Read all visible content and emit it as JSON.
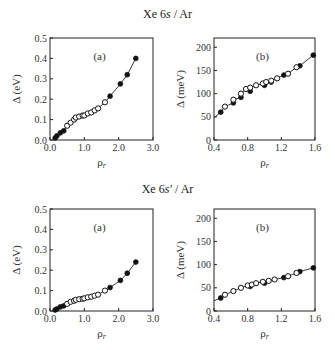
{
  "sections": [
    {
      "title_main": "Xe 6",
      "title_italic": "s",
      "title_rest": " / Ar"
    },
    {
      "title_main": "Xe 6",
      "title_italic": "s′",
      "title_rest": " / Ar"
    }
  ],
  "chart_data": [
    {
      "type": "scatter",
      "section": "Xe 6s / Ar",
      "panel_label": "(a)",
      "xlabel": "ρ_r",
      "ylabel": "Δ (eV)",
      "xlim": [
        0,
        3.0
      ],
      "ylim": [
        0,
        0.5
      ],
      "xticks": [
        "0.0",
        "1.0",
        "2.0",
        "3.0"
      ],
      "yticks": [
        "0.0",
        "0.1",
        "0.2",
        "0.3",
        "0.4",
        "0.5"
      ],
      "series": [
        {
          "name": "filled",
          "marker": "filled-circle",
          "line": true,
          "x": [
            0.15,
            0.2,
            0.3,
            0.4,
            1.75,
            2.05,
            2.25,
            2.5
          ],
          "y": [
            0.01,
            0.02,
            0.035,
            0.045,
            0.215,
            0.275,
            0.32,
            0.4
          ]
        },
        {
          "name": "open",
          "marker": "open-circle",
          "line": false,
          "x": [
            0.5,
            0.6,
            0.7,
            0.75,
            0.85,
            0.95,
            1.0,
            1.1,
            1.2,
            1.3,
            1.4,
            1.6
          ],
          "y": [
            0.07,
            0.085,
            0.1,
            0.11,
            0.115,
            0.12,
            0.12,
            0.13,
            0.135,
            0.145,
            0.155,
            0.185
          ]
        }
      ]
    },
    {
      "type": "scatter",
      "section": "Xe 6s / Ar",
      "panel_label": "(b)",
      "xlabel": "ρ_r",
      "ylabel": "Δ (meV)",
      "xlim": [
        0.4,
        1.6
      ],
      "ylim": [
        0,
        220
      ],
      "xticks": [
        "0.4",
        "0.8",
        "1.2",
        "1.6"
      ],
      "yticks": [
        "0",
        "50",
        "100",
        "150",
        "200"
      ],
      "series": [
        {
          "name": "filled",
          "marker": "filled-circle",
          "line": true,
          "x": [
            0.4,
            0.48,
            0.63,
            0.72,
            0.83,
            1.0,
            1.08,
            1.23,
            1.42,
            1.58
          ],
          "y": [
            48,
            60,
            80,
            92,
            105,
            118,
            125,
            140,
            160,
            183
          ]
        },
        {
          "name": "open",
          "marker": "open-circle",
          "line": false,
          "x": [
            0.53,
            0.63,
            0.72,
            0.78,
            0.83,
            0.9,
            0.98,
            1.02,
            1.08,
            1.15,
            1.28,
            1.38
          ],
          "y": [
            72,
            87,
            100,
            110,
            113,
            118,
            122,
            125,
            128,
            133,
            143,
            157
          ]
        }
      ]
    },
    {
      "type": "scatter",
      "section": "Xe 6s′ / Ar",
      "panel_label": "(a)",
      "xlabel": "ρ_r",
      "ylabel": "Δ (eV)",
      "xlim": [
        0,
        3.0
      ],
      "ylim": [
        0,
        0.5
      ],
      "xticks": [
        "0.0",
        "1.0",
        "2.0",
        "3.0"
      ],
      "yticks": [
        "0.0",
        "0.1",
        "0.2",
        "0.3",
        "0.4",
        "0.5"
      ],
      "series": [
        {
          "name": "filled",
          "marker": "filled-circle",
          "line": true,
          "x": [
            0.15,
            0.2,
            0.3,
            0.4,
            1.75,
            2.05,
            2.25,
            2.5
          ],
          "y": [
            0.005,
            0.01,
            0.02,
            0.025,
            0.115,
            0.15,
            0.185,
            0.24
          ]
        },
        {
          "name": "open",
          "marker": "open-circle",
          "line": false,
          "x": [
            0.5,
            0.6,
            0.7,
            0.75,
            0.85,
            0.95,
            1.0,
            1.1,
            1.2,
            1.3,
            1.4,
            1.6
          ],
          "y": [
            0.035,
            0.045,
            0.05,
            0.055,
            0.058,
            0.06,
            0.062,
            0.067,
            0.07,
            0.075,
            0.08,
            0.1
          ]
        }
      ]
    },
    {
      "type": "scatter",
      "section": "Xe 6s′ / Ar",
      "panel_label": "(b)",
      "xlabel": "ρ_r",
      "ylabel": "Δ (meV)",
      "xlim": [
        0.4,
        1.6
      ],
      "ylim": [
        0,
        220
      ],
      "xticks": [
        "0.4",
        "0.8",
        "1.2",
        "1.6"
      ],
      "yticks": [
        "0",
        "50",
        "100",
        "150",
        "200"
      ],
      "series": [
        {
          "name": "filled",
          "marker": "filled-circle",
          "line": true,
          "x": [
            0.4,
            0.48,
            0.83,
            1.0,
            1.23,
            1.42,
            1.58
          ],
          "y": [
            22,
            28,
            53,
            60,
            72,
            85,
            93
          ]
        },
        {
          "name": "open",
          "marker": "open-circle",
          "line": false,
          "x": [
            0.53,
            0.63,
            0.72,
            0.8,
            0.85,
            0.9,
            0.98,
            1.05,
            1.12,
            1.28,
            1.38
          ],
          "y": [
            35,
            43,
            50,
            55,
            57,
            60,
            63,
            65,
            68,
            75,
            82
          ]
        }
      ]
    }
  ],
  "caption_fragment": "… (b) …"
}
